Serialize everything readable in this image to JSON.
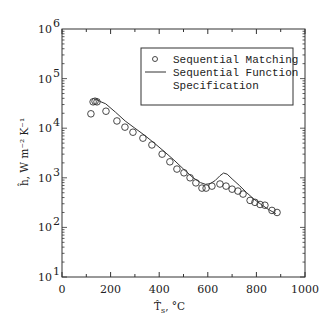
{
  "chart_data": {
    "type": "scatter",
    "title": "",
    "xlabel": "T̂s, °C",
    "ylabel": "ĥ, W m⁻² K⁻¹",
    "xlim": [
      0,
      1000
    ],
    "ylim": [
      10,
      1000000
    ],
    "yscale": "log",
    "grid": false,
    "legend_position": "upper right",
    "x_ticks": [
      0,
      200,
      400,
      600,
      800,
      1000
    ],
    "y_ticks": [
      {
        "value": 10,
        "base": "10",
        "exp": "1"
      },
      {
        "value": 100,
        "base": "10",
        "exp": "2"
      },
      {
        "value": 1000,
        "base": "10",
        "exp": "3"
      },
      {
        "value": 10000,
        "base": "10",
        "exp": "4"
      },
      {
        "value": 100000,
        "base": "10",
        "exp": "5"
      },
      {
        "value": 1000000,
        "base": "10",
        "exp": "6"
      }
    ],
    "series": [
      {
        "name": "Sequential Matching",
        "style": "open-circle-markers",
        "x": [
          119,
          128,
          136,
          144,
          181,
          226,
          259,
          292,
          333,
          370,
          412,
          444,
          473,
          502,
          527,
          551,
          576,
          593,
          617,
          650,
          675,
          700,
          724,
          745,
          774,
          794,
          815,
          835,
          864,
          885
        ],
        "y": [
          19500,
          34000,
          35000,
          34000,
          22000,
          14000,
          10500,
          8300,
          6300,
          4600,
          3000,
          2100,
          1500,
          1260,
          1000,
          790,
          620,
          620,
          680,
          750,
          680,
          590,
          540,
          470,
          350,
          320,
          290,
          280,
          220,
          200
        ]
      },
      {
        "name": "Sequential Function Specification",
        "style": "solid-line",
        "x": [
          140,
          160,
          180,
          220,
          260,
          300,
          340,
          380,
          420,
          460,
          500,
          540,
          570,
          590,
          610,
          630,
          650,
          665,
          680,
          700,
          730,
          760,
          790,
          820,
          850,
          880
        ],
        "y": [
          38000,
          34000,
          31000,
          21000,
          14000,
          10000,
          7200,
          5000,
          3400,
          2300,
          1500,
          1000,
          800,
          740,
          760,
          880,
          1100,
          1250,
          1180,
          950,
          700,
          500,
          370,
          290,
          230,
          190
        ]
      }
    ]
  },
  "legend": {
    "items": [
      {
        "label": "Sequential Matching",
        "marker": "circle"
      },
      {
        "label": "Sequential Function",
        "marker": "line"
      },
      {
        "label": "Specification",
        "marker": "none"
      }
    ]
  },
  "axes": {
    "x_label_main": "T̂",
    "x_label_sub": "s",
    "x_label_unit": ", °C",
    "y_label": "ĥ, W m⁻² K⁻¹"
  },
  "colors": {
    "ink": "#333333",
    "background": "#ffffff"
  }
}
